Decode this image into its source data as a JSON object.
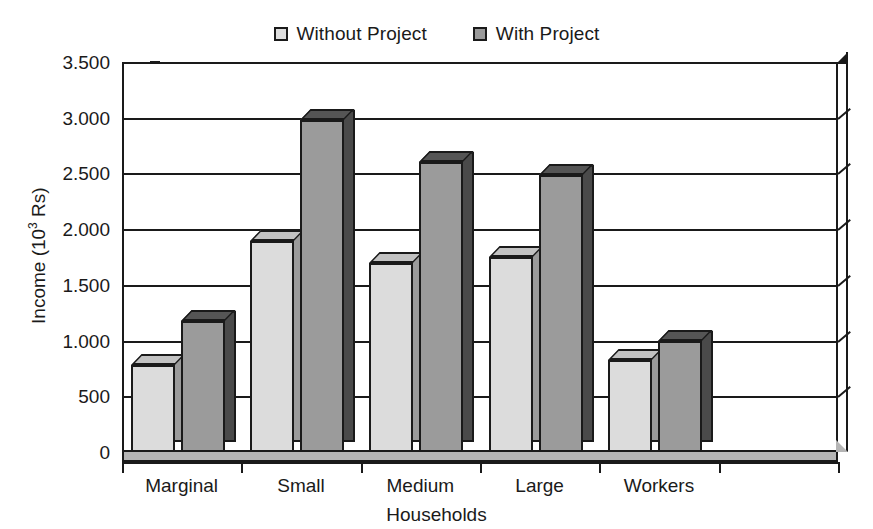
{
  "chart_data": {
    "type": "bar",
    "title": "",
    "subtitle": "",
    "xlabel": "Households",
    "ylabel": "Income (10³ Rs)",
    "ylabel_base": "Income (10",
    "ylabel_exp": "3",
    "ylabel_tail": " Rs)",
    "categories": [
      "Marginal",
      "Small",
      "Medium",
      "Large",
      "Workers"
    ],
    "series": [
      {
        "name": "Without Project",
        "color": "#dcdcdc",
        "values": [
          780,
          1890,
          1700,
          1750,
          830
        ]
      },
      {
        "name": "With Project",
        "color": "#9b9b9b",
        "values": [
          1180,
          2980,
          2600,
          2490,
          1000
        ]
      }
    ],
    "ylim": [
      0,
      3500
    ],
    "ytick_values": [
      0,
      500,
      1000,
      1500,
      2000,
      2500,
      3000,
      3500
    ],
    "ytick_labels": [
      "0",
      "500",
      "1.000",
      "1.500",
      "2.000",
      "2.500",
      "3.000",
      "3.500"
    ],
    "grid": true,
    "grid_axis": "y",
    "legend_position": "top-center",
    "style": "3d-clustered-column",
    "empty_trailing_slots": 1
  },
  "legend": {
    "entries": [
      {
        "label": "Without Project",
        "swatch_class": "without"
      },
      {
        "label": "With Project",
        "swatch_class": "with"
      }
    ]
  },
  "colors": {
    "without_project_face": "#dcdcdc",
    "without_project_side": "#9b9b9b",
    "without_project_top": "#c2c2c2",
    "with_project_face": "#9b9b9b",
    "with_project_side": "#4a4a4a",
    "with_project_top": "#555555",
    "axis": "#1a1a1a",
    "floor": "#b5b5b5",
    "background": "#ffffff"
  }
}
